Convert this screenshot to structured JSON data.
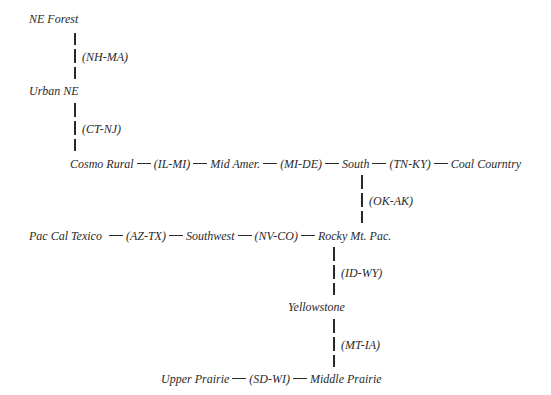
{
  "diagram": {
    "nodes": {
      "ne_forest": "NE Forest",
      "urban_ne": "Urban NE",
      "cosmo_rural": "Cosmo Rural",
      "mid_amer": "Mid Amer.",
      "south": "South",
      "coal_country": "Coal Courntry",
      "pac_cal_texico": "Pac Cal Texico",
      "southwest": "Southwest",
      "rocky_mt_pac": "Rocky Mt. Pac.",
      "yellowstone": "Yellowstone",
      "upper_prairie": "Upper Prairie",
      "middle_prairie": "Middle Prairie"
    },
    "edges": {
      "nh_ma": "(NH-MA)",
      "ct_nj": "(CT-NJ)",
      "il_mi": "(IL-MI)",
      "mi_de": "(MI-DE)",
      "tn_ky": "(TN-KY)",
      "ok_ak": "(OK-AK)",
      "az_tx": "(AZ-TX)",
      "nv_co": "(NV-CO)",
      "id_wy": "(ID-WY)",
      "mt_ia": "(MT-IA)",
      "sd_wi": "(SD-WI)"
    }
  }
}
